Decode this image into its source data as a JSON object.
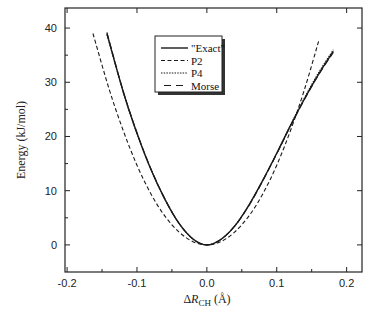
{
  "chart_data": {
    "type": "line",
    "title": "",
    "xlabel": "ΔR_CH (Å)",
    "xlabel_parts": {
      "prefix": "Δ",
      "var": "R",
      "sub": "CH",
      "unit": " (Å)"
    },
    "ylabel": "Energy (kJ/mol)",
    "xlim": [
      -0.203,
      0.222
    ],
    "ylim": [
      -5,
      43.7
    ],
    "xticks": [
      -0.2,
      -0.1,
      0.0,
      0.1,
      0.2
    ],
    "xtick_labels": [
      "-0.2",
      "-0.1",
      "0.0",
      "0.1",
      "0.2"
    ],
    "xminor": [
      -0.15,
      -0.05,
      0.05,
      0.15
    ],
    "yticks": [
      0,
      10,
      20,
      30,
      40
    ],
    "ytick_labels": [
      "0",
      "10",
      "20",
      "30",
      "40"
    ],
    "yminor": [
      5,
      15,
      25,
      35
    ],
    "grid": false,
    "legend_position": "upper center (inside plot)",
    "series": [
      {
        "name": "\"Exact\"",
        "style": "solid",
        "x": [
          -0.143,
          -0.12,
          -0.1,
          -0.08,
          -0.06,
          -0.04,
          -0.02,
          0.0,
          0.02,
          0.04,
          0.06,
          0.08,
          0.1,
          0.12,
          0.14,
          0.16,
          0.181
        ],
        "values": [
          39.0,
          28.4,
          20.6,
          13.9,
          8.4,
          4.0,
          1.1,
          0.0,
          1.0,
          3.5,
          7.3,
          11.9,
          16.9,
          22.1,
          27.0,
          31.5,
          35.7
        ]
      },
      {
        "name": "P2",
        "style": "dashed",
        "x": [
          -0.163,
          -0.14,
          -0.12,
          -0.1,
          -0.08,
          -0.06,
          -0.04,
          -0.02,
          0.0,
          0.02,
          0.04,
          0.06,
          0.08,
          0.1,
          0.12,
          0.14,
          0.16
        ],
        "values": [
          39.0,
          28.8,
          21.2,
          14.7,
          9.4,
          5.3,
          2.4,
          0.6,
          0.0,
          0.6,
          2.4,
          5.3,
          9.4,
          14.7,
          21.2,
          28.8,
          37.6
        ]
      },
      {
        "name": "P4",
        "style": "dotted",
        "x": [
          -0.143,
          -0.12,
          -0.1,
          -0.08,
          -0.06,
          -0.04,
          -0.02,
          0.0,
          0.02,
          0.04,
          0.06,
          0.08,
          0.1,
          0.12,
          0.14,
          0.16,
          0.181
        ],
        "values": [
          38.8,
          28.3,
          20.5,
          13.9,
          8.4,
          4.0,
          1.1,
          0.0,
          1.0,
          3.5,
          7.3,
          11.9,
          16.9,
          22.2,
          27.2,
          31.8,
          36.0
        ]
      },
      {
        "name": "Morse",
        "style": "longdash",
        "x": [
          -0.143,
          -0.12,
          -0.1,
          -0.08,
          -0.06,
          -0.04,
          -0.02,
          0.0,
          0.02,
          0.04,
          0.06,
          0.08,
          0.1,
          0.12,
          0.14,
          0.16,
          0.181
        ],
        "values": [
          39.2,
          28.5,
          20.7,
          14.0,
          8.5,
          4.0,
          1.1,
          0.0,
          1.0,
          3.5,
          7.2,
          11.8,
          16.8,
          22.0,
          26.9,
          31.4,
          35.5
        ]
      }
    ]
  },
  "legend": {
    "items": [
      {
        "label": "\"Exact\"",
        "style": "solid"
      },
      {
        "label": "P2",
        "style": "dashed"
      },
      {
        "label": "P4",
        "style": "dotted"
      },
      {
        "label": "Morse",
        "style": "longdash"
      }
    ]
  },
  "colors": {
    "line": "#1a1a1a",
    "frame": "#222222",
    "background": "#ffffff"
  }
}
